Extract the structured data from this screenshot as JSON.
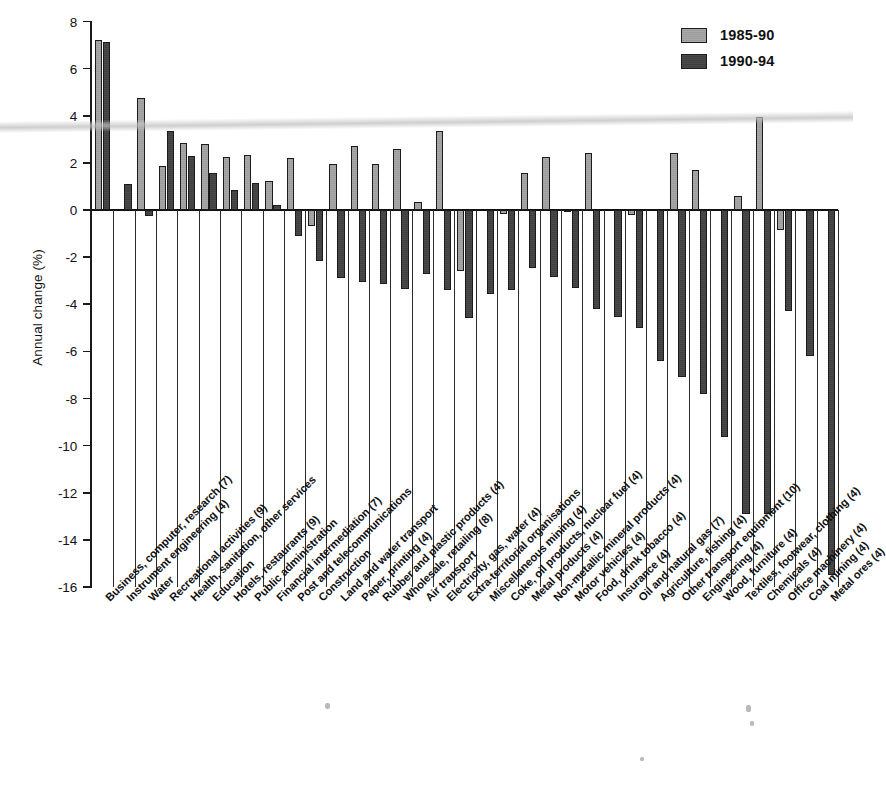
{
  "chart_data": {
    "type": "bar",
    "title": "",
    "xlabel": "",
    "ylabel": "Annual change (%)",
    "ylim": [
      -16,
      8
    ],
    "yticks": [
      8,
      6,
      4,
      2,
      0,
      -2,
      -4,
      -6,
      -8,
      -10,
      -12,
      -14,
      -16
    ],
    "ytick_labels": [
      "8",
      "6",
      "4",
      "2",
      "0",
      "-2",
      "-4",
      "-6",
      "-8",
      "-10",
      "-12",
      "-14",
      "-16"
    ],
    "grid": true,
    "legend_position": "top-right",
    "legend": [
      "1985-90",
      "1990-94"
    ],
    "categories": [
      "Business, computer, research (7)",
      "Instrument engineering (4)",
      "Water",
      "Recreational activities (9)",
      "Health, sanitation, other services",
      "Education",
      "Hotels, restaurants (9)",
      "Public administration",
      "Financial intermediation (7)",
      "Post and telecommunications",
      "Construction",
      "Land and water transport",
      "Paper, printing (4)",
      "Rubber and plastic products (4)",
      "Wholesale, retailing (8)",
      "Air transport",
      "Electricity, gas, water (4)",
      "Extra-territorial organisations",
      "Miscellaneous mining (4)",
      "Coke, oil products, nuclear fuel (4)",
      "Metal products (4)",
      "Non-metallic mineral products (4)",
      "Motor vehicles (4)",
      "Food, drink tobacco (4)",
      "Insurance (4)",
      "Oil and natural gas (7)",
      "Agriculture, fishing (4)",
      "Other transport equipment (10)",
      "Engineering (4)",
      "Wood, furniture (4)",
      "Textiles, footwear, clothing (4)",
      "Chemicals (4)",
      "Office machinery (4)",
      "Coal mining (4)",
      "Metal ores (4)"
    ],
    "series": [
      {
        "name": "1985-90",
        "color": "#a3a3a3",
        "values": [
          7.2,
          0.0,
          4.75,
          1.85,
          2.85,
          2.8,
          2.25,
          2.35,
          1.25,
          2.2,
          -0.7,
          1.95,
          2.7,
          1.95,
          2.6,
          0.35,
          3.35,
          -2.6,
          0.0,
          -0.15,
          1.55,
          2.25,
          -0.1,
          2.4,
          0.0,
          -0.2,
          0.0,
          2.4,
          1.7,
          0.0,
          0.6,
          3.95,
          -0.85,
          0.0,
          0.0
        ]
      },
      {
        "name": "1990-94",
        "color": "#454545",
        "values": [
          7.15,
          1.1,
          -0.25,
          3.35,
          2.3,
          1.55,
          0.85,
          1.15,
          0.2,
          -1.1,
          -2.15,
          -2.9,
          -3.05,
          -3.15,
          -3.35,
          -2.7,
          -3.4,
          -4.6,
          -3.55,
          -3.4,
          -2.45,
          -2.85,
          -3.3,
          -4.2,
          -4.55,
          -5.0,
          -6.4,
          -7.1,
          -7.8,
          -9.65,
          -12.9,
          -12.9,
          -4.3,
          -6.2,
          -15.5
        ]
      }
    ]
  },
  "legend_items": [
    {
      "label": "1985-90",
      "style": "light"
    },
    {
      "label": "1990-94",
      "style": "dark"
    }
  ]
}
